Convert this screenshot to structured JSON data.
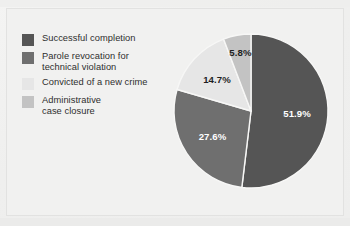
{
  "figure": {
    "background_color": "#f1f1f0",
    "border_color": "#e2e2e1"
  },
  "legend": {
    "position": "left",
    "items": [
      {
        "label": "Successful completion",
        "color": "#555555"
      },
      {
        "label": "Parole revocation for\ntechnical violation",
        "color": "#6f6f6f"
      },
      {
        "label": "Convicted of a new crime",
        "color": "#e6e6e6"
      },
      {
        "label": "Administrative\ncase closure",
        "color": "#c3c3c3"
      }
    ]
  },
  "chart_data": {
    "type": "pie",
    "title": "",
    "subtitle": "",
    "xlabel": "",
    "ylabel": "",
    "grid": false,
    "legend_position": "left",
    "start_angle_deg": 0,
    "direction": "clockwise",
    "value_unit": "percent",
    "categories": [
      "Successful completion",
      "Parole revocation for technical violation",
      "Convicted of a new crime",
      "Administrative case closure"
    ],
    "values": [
      51.9,
      27.6,
      14.7,
      5.8
    ],
    "data_labels": [
      "51.9%",
      "27.6%",
      "14.7%",
      "5.8%"
    ],
    "colors": [
      "#555555",
      "#6f6f6f",
      "#e6e6e6",
      "#c3c3c3"
    ],
    "label_text_colors": [
      "#ffffff",
      "#ffffff",
      "#1e1e1e",
      "#1e1e1e"
    ],
    "slice_border_color": "#f7f7f6",
    "total": 100.0
  }
}
